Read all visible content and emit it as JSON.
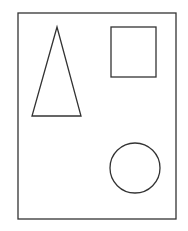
{
  "canvas": {
    "width": 188,
    "height": 231,
    "background": "#ffffff"
  },
  "stroke_color": "#333333",
  "shapes": {
    "frame": {
      "type": "rectangle",
      "x": 18,
      "y": 13,
      "width": 158,
      "height": 206
    },
    "triangle": {
      "type": "triangle",
      "points": "57,27 32,116 81,116"
    },
    "square": {
      "type": "square",
      "x": 111,
      "y": 27,
      "width": 45,
      "height": 50
    },
    "circle": {
      "type": "circle",
      "cx": 135,
      "cy": 168,
      "r": 25
    }
  }
}
